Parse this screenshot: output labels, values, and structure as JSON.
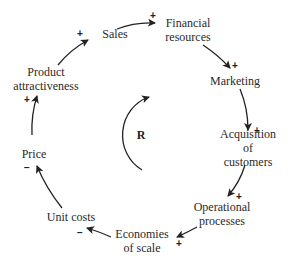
{
  "diagram": {
    "type": "causal-loop",
    "loop": {
      "label": "R",
      "meaning": "reinforcing"
    },
    "nodes": [
      {
        "id": "sales",
        "label": "Sales"
      },
      {
        "id": "financial_resources",
        "label": "Financial\nresources"
      },
      {
        "id": "marketing",
        "label": "Marketing"
      },
      {
        "id": "acquisition",
        "label": "Acquisition of\ncustomers"
      },
      {
        "id": "operational",
        "label": "Operational\nprocesses"
      },
      {
        "id": "economies",
        "label": "Economies\nof scale"
      },
      {
        "id": "unit_costs",
        "label": "Unit costs"
      },
      {
        "id": "price",
        "label": "Price"
      },
      {
        "id": "attractiveness",
        "label": "Product\nattractiveness"
      }
    ],
    "links": [
      {
        "from": "sales",
        "to": "financial_resources",
        "polarity": "+"
      },
      {
        "from": "financial_resources",
        "to": "marketing",
        "polarity": "+"
      },
      {
        "from": "marketing",
        "to": "acquisition",
        "polarity": "+"
      },
      {
        "from": "acquisition",
        "to": "operational",
        "polarity": "+"
      },
      {
        "from": "operational",
        "to": "economies",
        "polarity": "+"
      },
      {
        "from": "economies",
        "to": "unit_costs",
        "polarity": "−"
      },
      {
        "from": "unit_costs",
        "to": "price",
        "polarity": "−"
      },
      {
        "from": "price",
        "to": "attractiveness",
        "polarity": "+"
      },
      {
        "from": "attractiveness",
        "to": "sales",
        "polarity": "+"
      }
    ]
  }
}
